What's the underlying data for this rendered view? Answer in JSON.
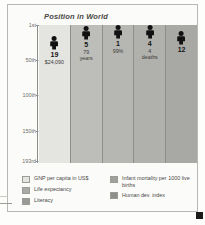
{
  "figure": {
    "title": "Position in World"
  },
  "chart_data": {
    "type": "bar",
    "title": "Position in World",
    "xlabel": "",
    "ylabel": "Position in World",
    "grid": true,
    "legend_position": "bottom",
    "ylim": [
      1,
      193
    ],
    "ytick_labels": [
      "1st",
      "50th",
      "100th",
      "150th",
      "193rd"
    ],
    "ytick_values": [
      1,
      50,
      100,
      150,
      193
    ],
    "categories": [
      "GNP per capita in US$",
      "Life expectancy",
      "Literacy",
      "Infant mortality per 1000 live births",
      "Human dev. index"
    ],
    "values": [
      19,
      5,
      1,
      4,
      12
    ],
    "series": [
      {
        "name": "World rank",
        "values": [
          19,
          5,
          1,
          4,
          12
        ]
      }
    ],
    "annotations": [
      {
        "rank": "19",
        "value": "$24,090",
        "unit": ""
      },
      {
        "rank": "5",
        "value": "79",
        "unit": "years"
      },
      {
        "rank": "1",
        "value": "99%",
        "unit": ""
      },
      {
        "rank": "4",
        "value": "4",
        "unit": "deaths"
      },
      {
        "rank": "12",
        "value": "",
        "unit": ""
      }
    ],
    "bar_colors": [
      "#e4e4e1",
      "#bdbdba",
      "#b6b6b3",
      "#b0b0ad",
      "#a8a8a5"
    ]
  },
  "bars": [
    {
      "id": "gnp-per-capita",
      "rank": "19",
      "line1": "$24,090",
      "line2": "",
      "rank_value": 19,
      "color": "#e4e4e1"
    },
    {
      "id": "life-expectancy",
      "rank": "5",
      "line1": "79",
      "line2": "years",
      "rank_value": 5,
      "color": "#bdbdba"
    },
    {
      "id": "literacy",
      "rank": "1",
      "line1": "99%",
      "line2": "",
      "rank_value": 1,
      "color": "#b6b6b3"
    },
    {
      "id": "infant-mortality",
      "rank": "4",
      "line1": "4",
      "line2": "deaths",
      "rank_value": 4,
      "color": "#b0b0ad"
    },
    {
      "id": "human-dev-index",
      "rank": "12",
      "line1": "",
      "line2": "",
      "rank_value": 12,
      "color": "#a8a8a5"
    }
  ],
  "axis": {
    "ticks": [
      {
        "label": "1st",
        "value": 1
      },
      {
        "label": "50th",
        "value": 50
      },
      {
        "label": "100th",
        "value": 100
      },
      {
        "label": "150th",
        "value": 150
      },
      {
        "label": "193rd",
        "value": 193
      }
    ]
  },
  "legend": {
    "left": [
      {
        "label": "GNP per capita in US$",
        "color": "#e4e4e1"
      },
      {
        "label": "Life expectancy",
        "color": "#a9a9a6"
      },
      {
        "label": "Literacy",
        "color": "#9a9a97"
      }
    ],
    "right": [
      {
        "label": "Infant mortality per 1000 live births",
        "color": "#a0a09d"
      },
      {
        "label": "Human dev. index",
        "color": "#8e8e8b"
      }
    ]
  }
}
